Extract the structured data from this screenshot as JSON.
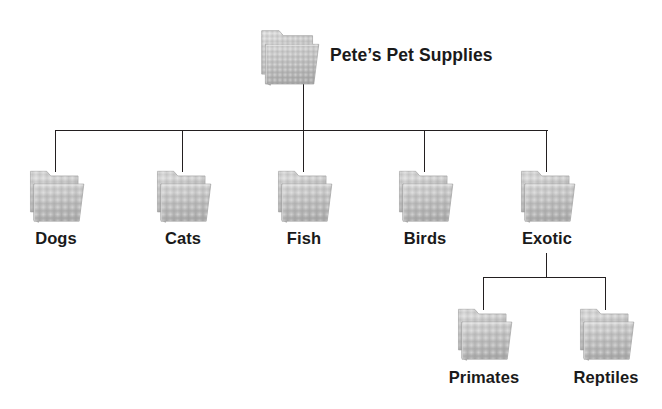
{
  "diagram": {
    "type": "folder-hierarchy-tree",
    "background_color": "#ffffff",
    "line_color": "#231f20",
    "folder_color": "#bfbfbf",
    "text_color": "#1a1a1a",
    "root": {
      "id": "petes-pet-supplies",
      "label": "Pete’s Pet Supplies",
      "icon": "folder-icon"
    },
    "level2": [
      {
        "id": "dogs",
        "label": "Dogs",
        "icon": "folder-icon"
      },
      {
        "id": "cats",
        "label": "Cats",
        "icon": "folder-icon"
      },
      {
        "id": "fish",
        "label": "Fish",
        "icon": "folder-icon"
      },
      {
        "id": "birds",
        "label": "Birds",
        "icon": "folder-icon"
      },
      {
        "id": "exotic",
        "label": "Exotic",
        "icon": "folder-icon"
      }
    ],
    "level3": [
      {
        "id": "primates",
        "label": "Primates",
        "icon": "folder-icon",
        "parent": "exotic"
      },
      {
        "id": "reptiles",
        "label": "Reptiles",
        "icon": "folder-icon",
        "parent": "exotic"
      }
    ]
  }
}
